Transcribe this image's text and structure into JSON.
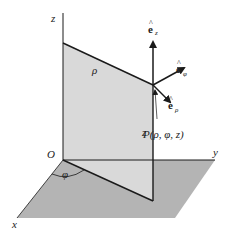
{
  "axes": {
    "x": "x",
    "y": "y",
    "z": "z",
    "origin": "O"
  },
  "labels": {
    "rho": "ρ",
    "phi": "φ",
    "z_height": "z",
    "point": "P(ρ, φ, z)"
  },
  "unit_vectors": [
    {
      "name": "e",
      "subscript": "z"
    },
    {
      "name": "e",
      "subscript": "φ"
    },
    {
      "name": "e",
      "subscript": "ρ"
    }
  ],
  "colors": {
    "ground_plane": "#b4b4b4",
    "half_plane": "#d8d8d8",
    "lines": "#1a1a1a"
  }
}
